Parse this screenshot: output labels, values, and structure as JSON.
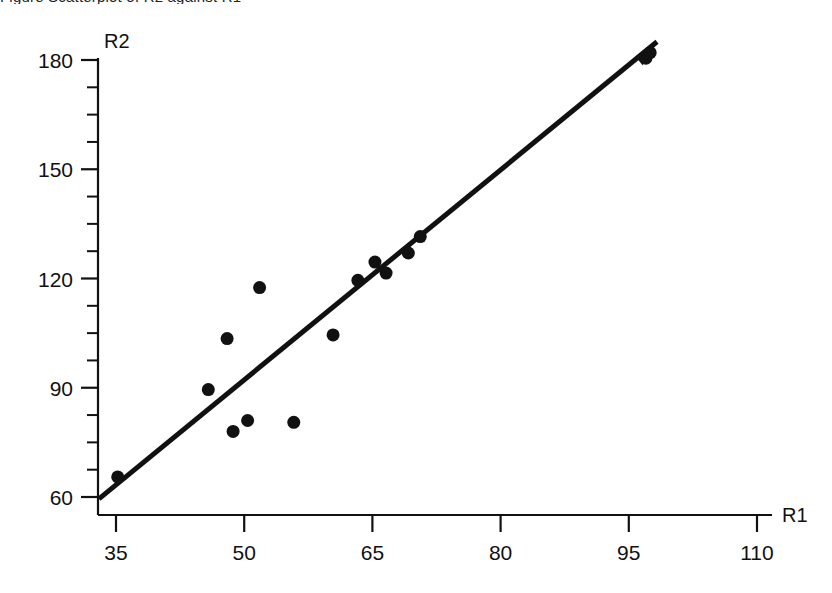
{
  "figure": {
    "clipped_top_caption": "Figure  Scatterplot of R2 against R1",
    "background_color": "#ffffff",
    "ink_color": "#111111"
  },
  "chart_data": {
    "type": "scatter",
    "title": "",
    "subtitle": "",
    "xlabel": "R1",
    "ylabel": "R2",
    "xlim": [
      31,
      112
    ],
    "ylim": [
      56,
      184
    ],
    "x_ticks": [
      35,
      50,
      65,
      80,
      95,
      110
    ],
    "y_ticks": [
      60,
      90,
      120,
      150,
      180
    ],
    "x_tick_labels": [
      "35",
      "50",
      "65",
      "80",
      "95",
      "110"
    ],
    "y_tick_labels": [
      "60",
      "90",
      "120",
      "150",
      "180"
    ],
    "x_minor_ticks": [],
    "y_minor_ticks": [
      67.5,
      75,
      82.5,
      97.5,
      105,
      112.5,
      127.5,
      135,
      142.5,
      157.5,
      165,
      172.5
    ],
    "grid": false,
    "legend": null,
    "axis_style": "open-l-shape-with-arrowless-x-axis",
    "marker": {
      "shape": "filled-circle",
      "color": "#111111",
      "size_px": 13
    },
    "points": [
      {
        "x": 35.2,
        "y": 65.5
      },
      {
        "x": 45.8,
        "y": 89.5
      },
      {
        "x": 48.0,
        "y": 103.5
      },
      {
        "x": 48.7,
        "y": 78.0
      },
      {
        "x": 50.4,
        "y": 81.0
      },
      {
        "x": 51.8,
        "y": 117.5
      },
      {
        "x": 55.8,
        "y": 80.5
      },
      {
        "x": 60.4,
        "y": 104.5
      },
      {
        "x": 63.3,
        "y": 119.5
      },
      {
        "x": 65.3,
        "y": 124.5
      },
      {
        "x": 66.6,
        "y": 121.5
      },
      {
        "x": 69.2,
        "y": 127.0
      },
      {
        "x": 70.6,
        "y": 131.5
      },
      {
        "x": 97.0,
        "y": 180.5
      },
      {
        "x": 97.5,
        "y": 182.0
      }
    ],
    "trend_line": {
      "type": "line-with-arrow-head",
      "color": "#111111",
      "width_px": 5,
      "from": {
        "x": 33.0,
        "y": 59.5
      },
      "to": {
        "x": 98.3,
        "y": 185.0
      },
      "arrow_at": "end"
    }
  }
}
